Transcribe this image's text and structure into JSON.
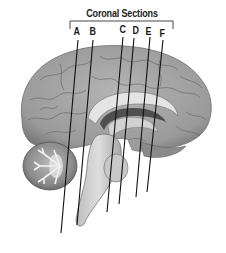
{
  "diagram": {
    "title": "Coronal Sections",
    "colors": {
      "background": "#ffffff",
      "brain_gray": "#9a9a9a",
      "line": "#111111",
      "text": "#1a1a1a"
    },
    "sections": [
      {
        "label": "A",
        "label_x": 74,
        "top": [
          78,
          40
        ],
        "bottom": [
          61,
          233
        ]
      },
      {
        "label": "B",
        "label_x": 91,
        "top": [
          93,
          40
        ],
        "bottom": [
          77,
          225
        ]
      },
      {
        "label": "C",
        "label_x": 121,
        "top": [
          123,
          37
        ],
        "bottom": [
          107,
          212
        ]
      },
      {
        "label": "D",
        "label_x": 133,
        "top": [
          134,
          38
        ],
        "bottom": [
          119,
          204
        ]
      },
      {
        "label": "E",
        "label_x": 146,
        "top": [
          150,
          37
        ],
        "bottom": [
          136,
          197
        ]
      },
      {
        "label": "F",
        "label_x": 159,
        "top": [
          163,
          40
        ],
        "bottom": [
          147,
          192
        ]
      }
    ]
  }
}
